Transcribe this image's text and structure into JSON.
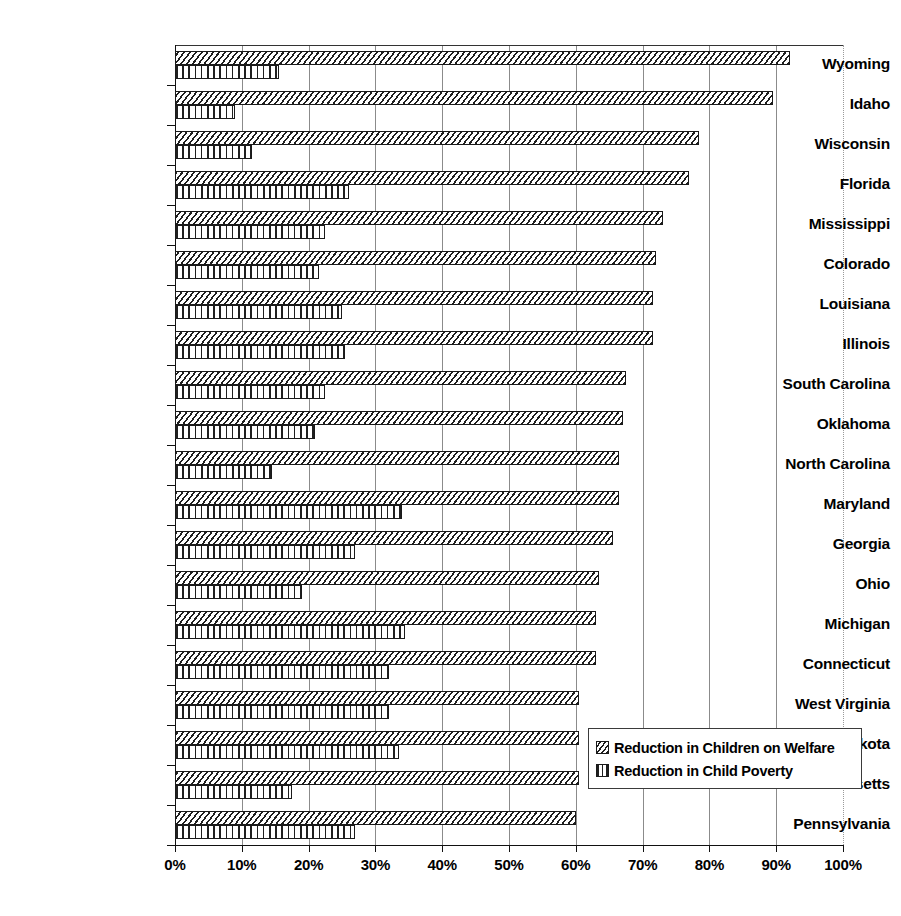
{
  "chart_data": {
    "type": "bar",
    "orientation": "horizontal",
    "title": "",
    "xlabel": "",
    "ylabel": "",
    "xlim": [
      0,
      100
    ],
    "xtick_labels": [
      "0%",
      "10%",
      "20%",
      "30%",
      "40%",
      "50%",
      "60%",
      "70%",
      "80%",
      "90%",
      "100%"
    ],
    "xtick_values": [
      0,
      10,
      20,
      30,
      40,
      50,
      60,
      70,
      80,
      90,
      100
    ],
    "grid": true,
    "grid_axis": "x",
    "legend_position": "lower-right-inside",
    "categories": [
      "Wyoming",
      "Idaho",
      "Wisconsin",
      "Florida",
      "Mississippi",
      "Colorado",
      "Louisiana",
      "Illinois",
      "South Carolina",
      "Oklahoma",
      "North Carolina",
      "Maryland",
      "Georgia",
      "Ohio",
      "Michigan",
      "Connecticut",
      "West Virginia",
      "South Dakota",
      "Massachusetts",
      "Pennsylvania"
    ],
    "series": [
      {
        "name": "Reduction in Children on Welfare",
        "pattern": "diagonal-hatch",
        "values": [
          92,
          89.5,
          78.5,
          77,
          73,
          72,
          71.5,
          71.5,
          67.5,
          67,
          66.5,
          66.5,
          65.5,
          63.5,
          63,
          63,
          60.5,
          60.5,
          60.5,
          60
        ]
      },
      {
        "name": "Reduction in Child Poverty",
        "pattern": "vertical-hatch",
        "values": [
          15.5,
          9,
          11.5,
          26,
          22.5,
          21.5,
          25,
          25.5,
          22.5,
          21,
          14.5,
          34,
          27,
          19,
          34.5,
          32,
          32,
          33.5,
          17.5,
          27
        ]
      }
    ]
  },
  "legend": {
    "items": [
      {
        "label": "Reduction in Children on Welfare",
        "swatch": "diagonal-hatch-swatch"
      },
      {
        "label": "Reduction in Child Poverty",
        "swatch": "vertical-hatch-swatch"
      }
    ]
  },
  "colors": {
    "background": "#ffffff",
    "ink": "#1a1a1a",
    "gridline": "#8b8b8b"
  }
}
